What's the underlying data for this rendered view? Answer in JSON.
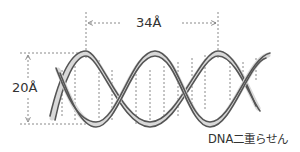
{
  "diagram": {
    "title": "DNA二重らせん",
    "pitch_label": "34Å",
    "diameter_label": "20Å",
    "colors": {
      "strand": "#555555",
      "strand_fill": "#d9d9d9",
      "guide": "#8a8a8a",
      "text": "#333333"
    }
  }
}
